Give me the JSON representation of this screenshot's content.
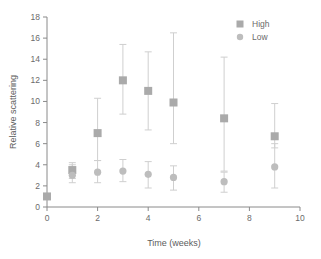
{
  "chart_data": {
    "type": "scatter",
    "title": "",
    "xlabel": "Time (weeks)",
    "ylabel": "Relative scattering",
    "xlim": [
      0,
      10
    ],
    "ylim": [
      0,
      18
    ],
    "xticks": [
      0,
      2,
      4,
      6,
      8,
      10
    ],
    "yticks": [
      0,
      2,
      4,
      6,
      8,
      10,
      12,
      14,
      16,
      18
    ],
    "xtick_labels": [
      "0",
      "2",
      "4",
      "6",
      "8",
      "10"
    ],
    "ytick_labels": [
      "0",
      "2",
      "4",
      "6",
      "8",
      "10",
      "12",
      "14",
      "16",
      "18"
    ],
    "grid": false,
    "legend_position": "top-right",
    "error_bars": true,
    "series": [
      {
        "name": "High",
        "marker": "square",
        "color": "#aaaaaa",
        "x": [
          0,
          1,
          2,
          3,
          4,
          5,
          7,
          9
        ],
        "values": [
          1.0,
          3.5,
          7.0,
          12.0,
          11.0,
          9.9,
          8.4,
          6.7
        ],
        "err_low": [
          1.0,
          2.7,
          4.4,
          8.8,
          7.3,
          6.0,
          3.4,
          5.6
        ],
        "err_high": [
          1.0,
          4.2,
          10.3,
          15.4,
          14.7,
          16.5,
          14.2,
          9.8
        ]
      },
      {
        "name": "Low",
        "marker": "circle",
        "color": "#bdbdbd",
        "x": [
          1,
          2,
          3,
          4,
          5,
          7,
          9
        ],
        "values": [
          3.0,
          3.3,
          3.4,
          3.1,
          2.8,
          2.4,
          3.8
        ],
        "err_low": [
          2.3,
          2.3,
          2.4,
          1.8,
          1.6,
          1.4,
          1.8
        ],
        "err_high": [
          4.0,
          4.4,
          4.5,
          4.3,
          3.9,
          3.3,
          6.0
        ]
      }
    ]
  },
  "legend": {
    "entries": [
      {
        "label": "High",
        "marker": "square"
      },
      {
        "label": "Low",
        "marker": "circle"
      }
    ]
  },
  "axes": {
    "x_title": "Time (weeks)",
    "y_title": "Relative scattering"
  },
  "colors": {
    "high": "#aaaaaa",
    "low": "#bdbdbd",
    "error": "#cfcfcf",
    "axis": "#8a8a8a",
    "text": "#6b6b6b",
    "background": "#ffffff"
  }
}
